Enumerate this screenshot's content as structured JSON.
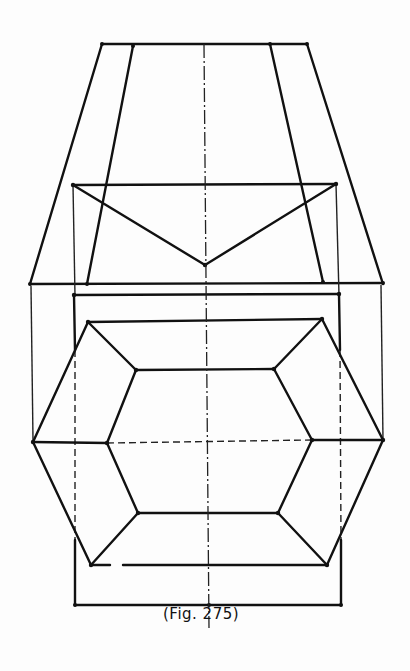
{
  "figure": {
    "caption": "(Fig. 275)",
    "type": "orthographic projection drawing",
    "views": [
      {
        "name": "elevation",
        "description": "trapezoidal frustum with V-shaped top section"
      },
      {
        "name": "plan",
        "description": "elongated hexagon with inner hexagon inside rectangle"
      }
    ]
  },
  "colors": {
    "line": "#111111",
    "paper": "#fdfdfd"
  }
}
